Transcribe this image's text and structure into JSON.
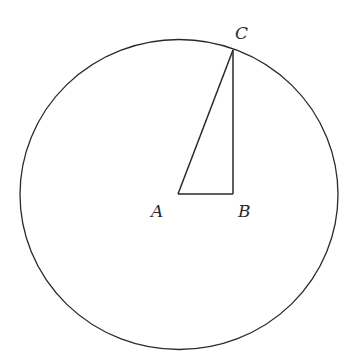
{
  "diagram": {
    "type": "geometry",
    "circle": {
      "cx": 179,
      "cy": 194,
      "rx": 159,
      "ry": 155,
      "stroke": "#2a2a2a"
    },
    "points": {
      "A": {
        "x": 178,
        "y": 194,
        "label": "A",
        "label_x": 150,
        "label_y": 216
      },
      "B": {
        "x": 233,
        "y": 194,
        "label": "B",
        "label_x": 238,
        "label_y": 216
      },
      "C": {
        "x": 233,
        "y": 50,
        "label": "C",
        "label_x": 236,
        "label_y": 38
      }
    },
    "segments": [
      {
        "from": "A",
        "to": "B"
      },
      {
        "from": "B",
        "to": "C"
      },
      {
        "from": "A",
        "to": "C"
      }
    ],
    "labels": {
      "A": "A",
      "B": "B",
      "C": "C"
    }
  }
}
